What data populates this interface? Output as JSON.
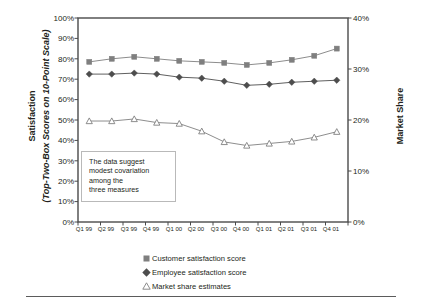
{
  "axes": {
    "y_left": {
      "title_line1": "Satisfaction",
      "title_line2": "(Top-Two-Box Scores on 10-Point Scale)",
      "ticks": [
        "100%",
        "90%",
        "80%",
        "70%",
        "60%",
        "50%",
        "40%",
        "30%",
        "20%",
        "10%",
        "0%"
      ]
    },
    "y_right": {
      "title": "Market Share",
      "ticks": [
        "40%",
        "30%",
        "20%",
        "10%",
        "0%"
      ]
    },
    "x": {
      "ticks": [
        "Q1 99",
        "Q2 99",
        "Q3 99",
        "Q4 99",
        "Q1 00",
        "Q2 00",
        "Q3 00",
        "Q4 00",
        "Q1 01",
        "Q2 01",
        "Q3 01",
        "Q4 01"
      ]
    }
  },
  "annotation": {
    "line1": "The data suggest",
    "line2": "modest covariation",
    "line3": "among the",
    "line4": "three measures"
  },
  "legend": [
    {
      "marker": "filled-square-icon",
      "label": "Customer satisfaction score"
    },
    {
      "marker": "filled-diamond-icon",
      "label": "Employee satisfaction score"
    },
    {
      "marker": "open-triangle-icon",
      "label": "Market share estimates"
    }
  ],
  "colors": {
    "series_customer": "#7f7f7f",
    "series_employee": "#4d4d4d",
    "series_market": "#808080",
    "frame": "#4a4a4a",
    "text": "#231f20",
    "annotation_border": "#b9b9b9",
    "rule": "#5b5b5b",
    "background": "#ffffff"
  },
  "chart_data": {
    "type": "line",
    "title": "",
    "xlabel": "",
    "ylabel": "Satisfaction (Top-Two-Box Scores on 10-Point Scale)",
    "y2label": "Market Share",
    "ylim": [
      0,
      100
    ],
    "y2lim": [
      0,
      40
    ],
    "grid": false,
    "legend_position": "bottom",
    "categories": [
      "Q1 99",
      "Q2 99",
      "Q3 99",
      "Q4 99",
      "Q1 00",
      "Q2 00",
      "Q3 00",
      "Q4 00",
      "Q1 01",
      "Q2 01",
      "Q3 01",
      "Q4 01"
    ],
    "series": [
      {
        "name": "Customer satisfaction score",
        "axis": "left",
        "marker": "filled-square",
        "units": "percent",
        "values": [
          78.5,
          80.0,
          81.0,
          80.0,
          79.0,
          78.5,
          78.0,
          77.0,
          78.0,
          79.5,
          81.5,
          85.0
        ]
      },
      {
        "name": "Employee satisfaction score",
        "axis": "left",
        "marker": "filled-diamond",
        "units": "percent",
        "values": [
          72.5,
          72.5,
          73.0,
          72.5,
          71.0,
          70.5,
          69.0,
          67.0,
          67.5,
          68.5,
          69.0,
          69.5
        ]
      },
      {
        "name": "Market share estimates",
        "axis": "right",
        "marker": "open-triangle",
        "units": "percent",
        "values": [
          19.8,
          19.8,
          20.2,
          19.5,
          19.3,
          17.8,
          15.7,
          15.0,
          15.4,
          15.8,
          16.6,
          17.7
        ]
      }
    ]
  }
}
